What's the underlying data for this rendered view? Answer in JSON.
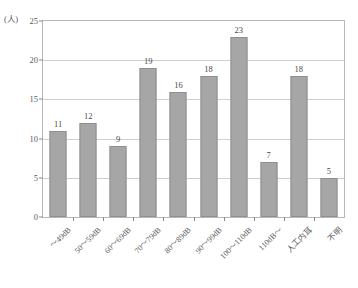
{
  "chart_data": {
    "type": "bar",
    "title": "",
    "subtitle": "",
    "xlabel": "",
    "ylabel": "",
    "unit_label": "(人)",
    "ylim": [
      0,
      25
    ],
    "yticks": [
      0,
      5,
      10,
      15,
      20,
      25
    ],
    "grid": true,
    "legend": "none",
    "bar_color": "#a6a6a6",
    "bar_edge_color": "#8f8f8f",
    "grid_color": "#cfcfcf",
    "frame_color": "#b8b8b8",
    "text_color": "#5a5a5a",
    "categories": [
      "〜49dB",
      "50〜59dB",
      "60〜69dB",
      "70〜79dB",
      "80〜89dB",
      "90〜99dB",
      "100〜110dB",
      "110dB〜",
      "人工内耳",
      "不明"
    ],
    "values": [
      11,
      12,
      9,
      19,
      16,
      18,
      23,
      7,
      18,
      5
    ]
  }
}
